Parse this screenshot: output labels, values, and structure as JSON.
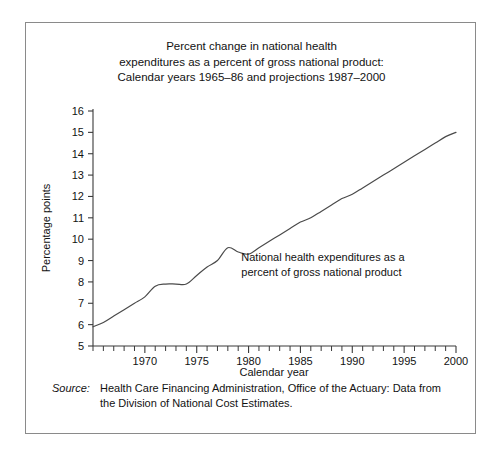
{
  "figure": {
    "title_lines": [
      "Percent change in national health",
      "expenditures as a percent of gross national product:",
      "Calendar years 1965–86 and projections 1987–2000"
    ],
    "source_label": "Source:",
    "source_text": "Health Care Financing Administration, Office of the Actuary: Data from the Division of National Cost Estimates.",
    "line_color": "#4a4a4a",
    "axis_color": "#3a3a3a",
    "border_color": "#8a8a8a"
  },
  "chart_data": {
    "type": "line",
    "title": "Percent change in national health expenditures as a percent of gross national product: Calendar years 1965–86 and projections 1987–2000",
    "xlabel": "Calendar year",
    "ylabel": "Percentage points",
    "xlim": [
      1965,
      2000
    ],
    "ylim": [
      5,
      16
    ],
    "ytick_labels": [
      "5",
      "6",
      "7",
      "8",
      "9",
      "10",
      "11",
      "12",
      "13",
      "14",
      "15",
      "16"
    ],
    "yticks": [
      5,
      6,
      7,
      8,
      9,
      10,
      11,
      12,
      13,
      14,
      15,
      16
    ],
    "xtick_labels": [
      "1970",
      "1975",
      "1980",
      "1985",
      "1990",
      "1995",
      "2000"
    ],
    "xticks_major": [
      1970,
      1975,
      1980,
      1985,
      1990,
      1995,
      2000
    ],
    "xticks_minor_step": 1,
    "grid": false,
    "legend": false,
    "annotations": [
      {
        "name": "series-annotation",
        "lines": [
          "National health expenditures as a",
          "percent of gross national product"
        ],
        "x": 1979.3,
        "y": 9.0
      }
    ],
    "series": [
      {
        "name": "National health expenditures as a percent of gross national product",
        "x": [
          1965,
          1966,
          1967,
          1968,
          1969,
          1970,
          1971,
          1972,
          1973,
          1974,
          1975,
          1976,
          1977,
          1978,
          1979,
          1980,
          1981,
          1982,
          1983,
          1984,
          1985,
          1986,
          1987,
          1988,
          1989,
          1990,
          1991,
          1992,
          1993,
          1994,
          1995,
          1996,
          1997,
          1998,
          1999,
          2000
        ],
        "values": [
          5.9,
          6.1,
          6.4,
          6.7,
          7.0,
          7.3,
          7.8,
          7.9,
          7.9,
          7.9,
          8.3,
          8.7,
          9.0,
          9.6,
          9.4,
          9.3,
          9.6,
          9.9,
          10.2,
          10.5,
          10.8,
          11.0,
          11.3,
          11.6,
          11.9,
          12.1,
          12.4,
          12.7,
          13.0,
          13.3,
          13.6,
          13.9,
          14.2,
          14.5,
          14.8,
          15.0
        ]
      }
    ]
  }
}
